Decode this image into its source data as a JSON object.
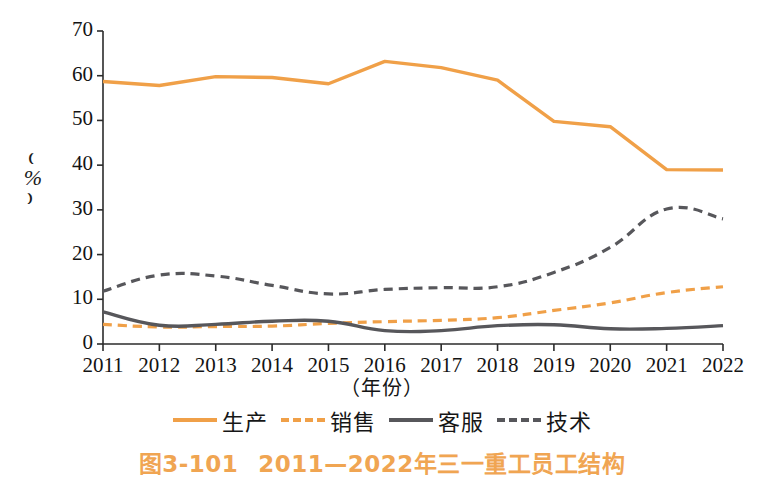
{
  "figure": {
    "caption_number": "图3-101",
    "caption_text": "2011—2022年三一重工员工结构",
    "caption_color": "#F0A552"
  },
  "axes": {
    "y_title": "（%）",
    "y_paren_open": "⌒",
    "y_unit": "%",
    "x_title": "（年份）",
    "y_ticks": [
      "0",
      "10",
      "20",
      "30",
      "40",
      "50",
      "60",
      "70"
    ],
    "x_ticks": [
      "2011",
      "2012",
      "2013",
      "2014",
      "2015",
      "2016",
      "2017",
      "2018",
      "2019",
      "2020",
      "2021",
      "2022"
    ]
  },
  "legend": {
    "items": [
      {
        "label": "生产",
        "color": "#F0A048",
        "style": "solid"
      },
      {
        "label": "销售",
        "color": "#F0A048",
        "style": "dashed"
      },
      {
        "label": "客服",
        "color": "#57575B",
        "style": "solid"
      },
      {
        "label": "技术",
        "color": "#57575B",
        "style": "dashed"
      }
    ]
  },
  "colors": {
    "orange": "#F0A048",
    "gray": "#57575B",
    "axis": "#2b2b2b",
    "caption": "#F0A552"
  },
  "chart_data": {
    "type": "line",
    "xlabel": "（年份）",
    "ylabel": "（%）",
    "x": [
      2011,
      2012,
      2013,
      2014,
      2015,
      2016,
      2017,
      2018,
      2019,
      2020,
      2021,
      2022
    ],
    "categories": [
      "2011",
      "2012",
      "2013",
      "2014",
      "2015",
      "2016",
      "2017",
      "2018",
      "2019",
      "2020",
      "2021",
      "2022"
    ],
    "xlim": [
      2011,
      2022
    ],
    "ylim": [
      0,
      70
    ],
    "ytick_step": 10,
    "grid": false,
    "legend_position": "bottom",
    "series": [
      {
        "name": "生产",
        "color": "#F0A048",
        "style": "solid",
        "values": [
          58.7,
          57.8,
          59.8,
          59.6,
          58.2,
          63.2,
          61.8,
          59.0,
          49.8,
          48.6,
          39.0,
          38.9
        ]
      },
      {
        "name": "销售",
        "color": "#F0A048",
        "style": "dashed",
        "values": [
          4.4,
          3.8,
          3.9,
          4.0,
          4.6,
          5.0,
          5.3,
          5.9,
          7.5,
          9.2,
          11.5,
          12.8
        ]
      },
      {
        "name": "客服",
        "color": "#57575B",
        "style": "solid",
        "values": [
          7.2,
          4.2,
          4.4,
          5.1,
          5.1,
          3.0,
          3.0,
          4.1,
          4.3,
          3.4,
          3.5,
          4.1
        ]
      },
      {
        "name": "技术",
        "color": "#57575B",
        "style": "dashed",
        "values": [
          11.8,
          15.4,
          15.2,
          13.1,
          11.2,
          12.2,
          12.6,
          12.8,
          16.0,
          21.6,
          30.2,
          28.0
        ]
      }
    ]
  }
}
